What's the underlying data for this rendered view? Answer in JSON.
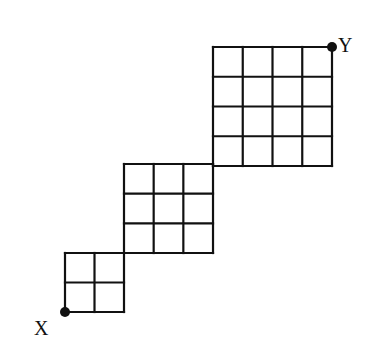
{
  "diagram": {
    "type": "grid-path",
    "stroke_color": "#111111",
    "background": "#ffffff",
    "grids": [
      {
        "name": "small-grid",
        "size": 2,
        "x": 65,
        "y": 253,
        "cell": 29.5
      },
      {
        "name": "medium-grid",
        "size": 3,
        "x": 124,
        "y": 164,
        "cell": 29.67
      },
      {
        "name": "large-grid",
        "size": 4,
        "x": 213,
        "y": 47,
        "cell": 29.75
      }
    ],
    "points": [
      {
        "name": "point-x",
        "label": "X",
        "cx": 65,
        "cy": 312,
        "label_x": 34,
        "label_y": 335
      },
      {
        "name": "point-y",
        "label": "Y",
        "cx": 332,
        "cy": 47,
        "label_x": 338,
        "label_y": 52
      }
    ]
  }
}
